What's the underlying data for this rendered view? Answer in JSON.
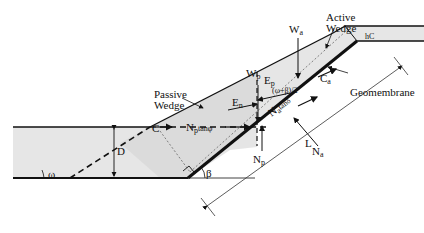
{
  "diagram": {
    "type": "cover soil slope wedge stability force diagram",
    "labels": {
      "passive_wedge": "Passive\nWedge",
      "active_wedge": "Active\nWedge",
      "geomembrane": "Geomembrane",
      "Wp_main": "W",
      "Wp_sub": "p",
      "Wa_main": "W",
      "Wa_sub": "a",
      "Ep_main": "E",
      "Ep_sub": "p",
      "En_main": "E",
      "En_sub": "n",
      "Ca_main": "C",
      "Ca_sub": "a",
      "C": "C",
      "Np_tan_main": "N",
      "Np_tan_sub": "p",
      "Np_tan_tail": "tanφ",
      "Na_tan_main": "N",
      "Na_tan_sub": "a",
      "Na_tan_tail": "tanδ",
      "Na_main": "N",
      "Na_sub": "a",
      "Np_main": "N",
      "Np_sub": "p",
      "angle_expr": "(ω+β)/2",
      "hC": "hC",
      "D": "D",
      "L": "L",
      "omega": "ω",
      "beta": "β"
    },
    "colors": {
      "soil_fill": "#e6e6e6",
      "line": "#111111",
      "dotted": "#666666"
    }
  }
}
